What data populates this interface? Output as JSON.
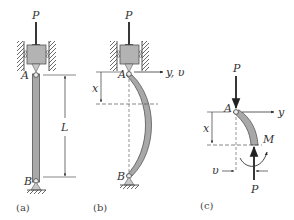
{
  "figure": {
    "panels": [
      {
        "caption": "(a)",
        "labels": {
          "load": "P",
          "top": "A",
          "bottom": "B",
          "length": "L"
        }
      },
      {
        "caption": "(b)",
        "labels": {
          "load": "P",
          "top": "A",
          "bottom": "B",
          "axis": "y, υ",
          "position": "x"
        }
      },
      {
        "caption": "(c)",
        "labels": {
          "load_top": "P",
          "top": "A",
          "axis": "y",
          "position": "x",
          "moment": "M",
          "deflection": "υ",
          "load_bottom": "P"
        }
      }
    ],
    "colors": {
      "column_fill": "#a8a8a8",
      "block_fill": "#b3b3b3",
      "line": "#333333"
    }
  }
}
